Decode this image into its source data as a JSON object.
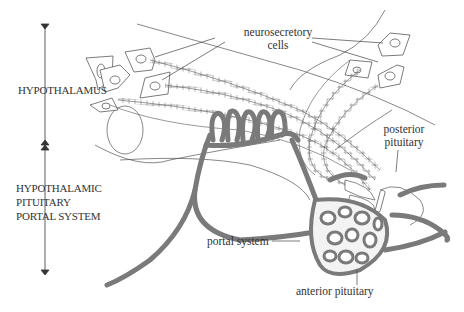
{
  "diagram": {
    "type": "anatomical illustration",
    "colors": {
      "vessel_fill": "#7a7a7a",
      "vessel_stroke": "#555555",
      "line": "#444444",
      "text": "#333333",
      "background": "#ffffff"
    },
    "regions": [
      {
        "id": "hypothalamus",
        "label": "HYPOTHALAMUS"
      },
      {
        "id": "portal",
        "label_lines": [
          "HYPOTHALAMIC",
          "PITUITARY",
          "PORTAL SYSTEM"
        ]
      }
    ],
    "labels": {
      "neurosecretory": {
        "line1": "neurosecretory",
        "line2": "cells"
      },
      "posterior": {
        "line1": "posterior",
        "line2": "pituitary"
      },
      "portal_system": "portal system",
      "anterior_pituitary": "anterior pituitary"
    }
  }
}
